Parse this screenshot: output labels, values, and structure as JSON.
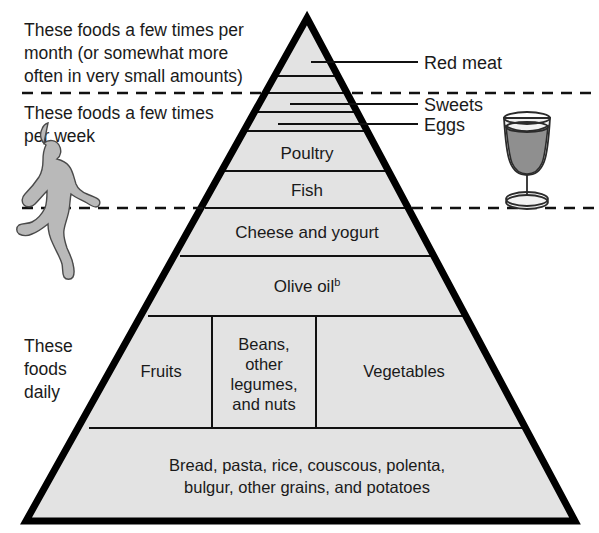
{
  "diagram": {
    "type": "food-pyramid",
    "colors": {
      "pyramid_fill": "#e3e3e3",
      "outline": "#000000",
      "runner_fill": "#b9b9b9",
      "wine_fill": "#8f8f8f",
      "background": "#ffffff"
    }
  },
  "left_notes": [
    {
      "id": "monthly",
      "lines": [
        "These foods a few times per",
        "month (or somewhat more",
        "often in very small amounts)"
      ]
    },
    {
      "id": "weekly",
      "lines": [
        "These foods a few times",
        "per week"
      ]
    },
    {
      "id": "daily",
      "lines": [
        "These",
        "foods",
        "daily"
      ]
    }
  ],
  "callouts": [
    {
      "id": "red-meat",
      "label": "Red meat"
    },
    {
      "id": "sweets",
      "label": "Sweets"
    },
    {
      "id": "eggs",
      "label": "Eggs"
    }
  ],
  "bands": [
    {
      "id": "poultry",
      "label": "Poultry"
    },
    {
      "id": "fish",
      "label": "Fish"
    },
    {
      "id": "cheese-and-yogurt",
      "label": "Cheese and yogurt"
    },
    {
      "id": "olive-oil",
      "label": "Olive oil",
      "superscript": "b"
    }
  ],
  "produce_row": [
    {
      "id": "fruits",
      "lines": [
        "Fruits"
      ]
    },
    {
      "id": "beans-legumes-nuts",
      "lines": [
        "Beans,",
        "other",
        "legumes,",
        "and nuts"
      ]
    },
    {
      "id": "vegetables",
      "lines": [
        "Vegetables"
      ]
    }
  ],
  "base_row": {
    "id": "grains",
    "lines": [
      "Bread, pasta, rice, couscous, polenta,",
      "bulgur, other grains, and potatoes"
    ]
  },
  "icons": {
    "runner": "running-person-icon",
    "wine": "wine-glass-icon"
  }
}
